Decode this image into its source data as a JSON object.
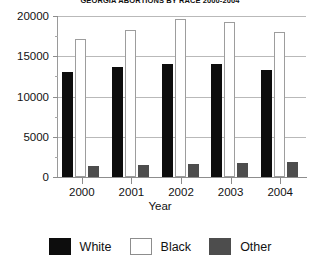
{
  "chart_data": {
    "type": "bar",
    "title": "GEORGIA ABORTIONS BY RACE 2000-2004",
    "xlabel": "Year",
    "ylabel": "",
    "categories": [
      "2000",
      "2001",
      "2002",
      "2003",
      "2004"
    ],
    "series": [
      {
        "name": "White",
        "color": "#0d0d0d",
        "values": [
          13100,
          13700,
          14000,
          14000,
          13300
        ]
      },
      {
        "name": "Black",
        "color": "#ffffff",
        "values": [
          17200,
          18300,
          19600,
          19300,
          18000
        ]
      },
      {
        "name": "Other",
        "color": "#4d4d4d",
        "values": [
          1400,
          1550,
          1600,
          1700,
          1900
        ]
      }
    ],
    "ylim": [
      0,
      20000
    ],
    "ytick_labels": [
      "0",
      "5000",
      "10000",
      "15000",
      "20000"
    ],
    "ytick_values": [
      0,
      5000,
      10000,
      15000,
      20000
    ],
    "yminor_values": [
      2500,
      7500,
      12500,
      17500
    ],
    "grid": true,
    "legend_position": "bottom"
  },
  "legend": {
    "items": [
      {
        "label": "White",
        "swatch": "solid-black-swatch"
      },
      {
        "label": "Black",
        "swatch": "outlined-white-swatch"
      },
      {
        "label": "Other",
        "swatch": "solid-gray-swatch"
      }
    ]
  }
}
